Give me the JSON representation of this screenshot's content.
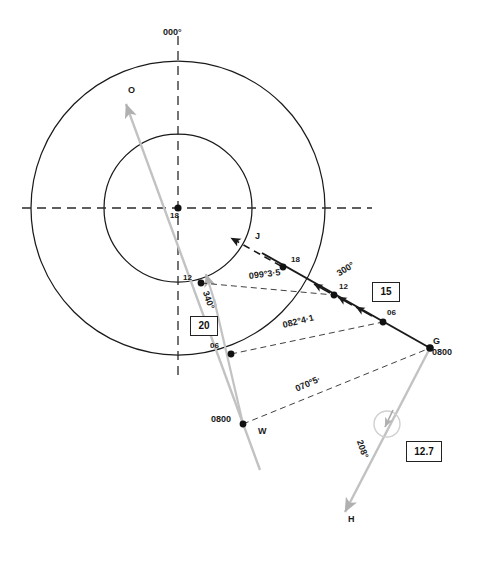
{
  "figure": {
    "kind": "radar-relative-motion-plot",
    "colors": {
      "ink": "#1a1a1a",
      "grey_vector": "#b8b8b8",
      "grey_vector_dark": "#9a9a9a"
    },
    "center": {
      "label": "18",
      "x": 178,
      "y": 208
    },
    "circles": [
      {
        "name": "inner-range-ring",
        "r": 74
      },
      {
        "name": "outer-range-ring",
        "r": 147
      }
    ],
    "axis_labels": {
      "north": "000°"
    },
    "bearing_labels": [
      {
        "name": "bearing-099",
        "text": "099°3·5",
        "x": 249,
        "y": 274,
        "rot": -7
      },
      {
        "name": "bearing-082",
        "text": "082°4·1",
        "x": 283,
        "y": 323,
        "rot": -14
      },
      {
        "name": "bearing-070",
        "text": "070°5·",
        "x": 296,
        "y": 385,
        "rot": -24
      },
      {
        "name": "course-340",
        "text": "340°",
        "x": 208,
        "y": 288,
        "rot": 70
      },
      {
        "name": "course-300",
        "text": "300°",
        "x": 339,
        "y": 268,
        "rot": -33
      },
      {
        "name": "course-208",
        "text": "208°",
        "x": 361,
        "y": 437,
        "rot": 70
      }
    ],
    "speed_boxes": [
      {
        "name": "speed-box-20",
        "text": "20",
        "x": 190,
        "y": 316,
        "w": 26,
        "h": 18
      },
      {
        "name": "speed-box-15",
        "text": "15",
        "x": 372,
        "y": 282,
        "w": 26,
        "h": 18
      },
      {
        "name": "speed-box-127",
        "text": "12.7",
        "x": 406,
        "y": 441,
        "w": 34,
        "h": 19
      }
    ],
    "vessel_labels": [
      {
        "name": "vector-label-o",
        "text": "O",
        "x": 130,
        "y": 90
      },
      {
        "name": "vector-label-j",
        "text": "J",
        "x": 256,
        "y": 235
      },
      {
        "name": "vector-label-h",
        "text": "H",
        "x": 349,
        "y": 518
      },
      {
        "name": "point-label-g",
        "text": "G",
        "x": 434,
        "y": 339
      },
      {
        "name": "point-label-w",
        "text": "W",
        "x": 259,
        "y": 430
      }
    ],
    "time_labels": [
      {
        "name": "time-label-g",
        "text": "0800",
        "x": 433,
        "y": 350
      },
      {
        "name": "time-label-w",
        "text": "0800",
        "x": 214,
        "y": 416
      }
    ],
    "plot_points": [
      {
        "name": "point-center-own-ship",
        "label": "18",
        "x": 178,
        "y": 208,
        "lx": 170,
        "ly": 212
      },
      {
        "name": "point-j-18",
        "label": "18",
        "x": 283,
        "y": 267,
        "lx": 291,
        "ly": 258
      },
      {
        "name": "point-j-12",
        "label": "12",
        "x": 334,
        "y": 295,
        "lx": 339,
        "ly": 285
      },
      {
        "name": "point-j-06",
        "label": "06",
        "x": 383,
        "y": 322,
        "lx": 387,
        "ly": 311
      },
      {
        "name": "point-g-0800",
        "label": "",
        "x": 430,
        "y": 348,
        "lx": 0,
        "ly": 0
      },
      {
        "name": "point-w-12",
        "label": "12",
        "x": 201,
        "y": 283,
        "lx": 184,
        "ly": 276
      },
      {
        "name": "point-w-06",
        "label": "06",
        "x": 231,
        "y": 354,
        "lx": 211,
        "ly": 344
      },
      {
        "name": "point-w-0800",
        "label": "",
        "x": 243,
        "y": 424,
        "lx": 0,
        "ly": 0
      }
    ]
  }
}
